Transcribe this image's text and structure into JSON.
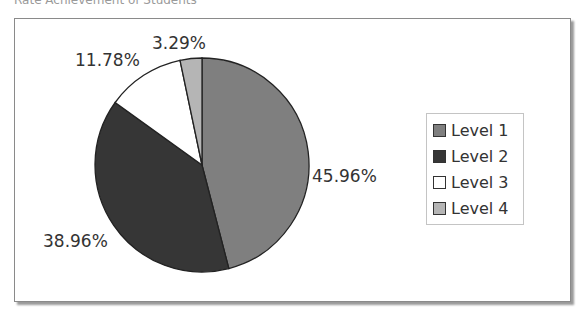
{
  "chart_data": {
    "type": "pie",
    "title": "Rate Achievement of Students",
    "categories": [
      "Level 1",
      "Level 2",
      "Level 3",
      "Level 4"
    ],
    "values": [
      45.96,
      38.96,
      11.78,
      3.29
    ],
    "labels": [
      "45.96%",
      "38.96%",
      "11.78%",
      "3.29%"
    ],
    "colors": [
      "#7f7f7f",
      "#363636",
      "#ffffff",
      "#b5b5b5"
    ],
    "legend_position": "right",
    "start_angle": "12 o'clock, clockwise"
  },
  "legend": {
    "items": [
      {
        "label": "Level 1",
        "color": "#7f7f7f"
      },
      {
        "label": "Level 2",
        "color": "#363636"
      },
      {
        "label": "Level 3",
        "color": "#ffffff"
      },
      {
        "label": "Level 4",
        "color": "#b5b5b5"
      }
    ]
  }
}
